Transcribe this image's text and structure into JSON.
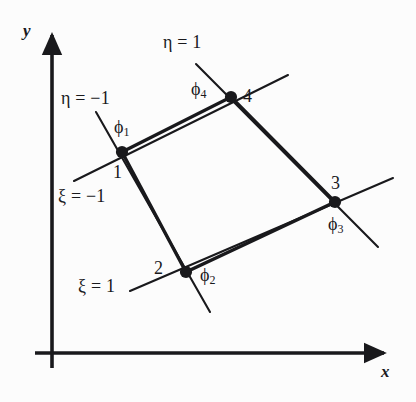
{
  "figure": {
    "background_color": "#fcfcfc",
    "line_color": "#19191c",
    "width": 416,
    "height": 402
  },
  "axes": {
    "x_label": "x",
    "y_label": "y",
    "origin": {
      "x": 52,
      "y": 353
    },
    "x_axis": {
      "start_x": 35,
      "end_x": 392,
      "y": 353
    },
    "y_axis": {
      "x": 52,
      "start_y": 368,
      "end_y": 27
    }
  },
  "element": {
    "nodes": [
      {
        "id": "1",
        "number_label": "1",
        "phi_label": "ϕ",
        "phi_sub": "1",
        "x": 122,
        "y": 152
      },
      {
        "id": "2",
        "number_label": "2",
        "phi_label": "ϕ",
        "phi_sub": "2",
        "x": 186,
        "y": 272
      },
      {
        "id": "3",
        "number_label": "3",
        "phi_label": "ϕ",
        "phi_sub": "3",
        "x": 335,
        "y": 202
      },
      {
        "id": "4",
        "number_label": "4",
        "phi_label": "ϕ",
        "phi_sub": "4",
        "x": 231,
        "y": 97
      }
    ],
    "edges": [
      {
        "from": "1",
        "to": "4"
      },
      {
        "from": "4",
        "to": "3"
      },
      {
        "from": "3",
        "to": "2"
      },
      {
        "from": "2",
        "to": "1"
      }
    ]
  },
  "natural_coordinate_lines": [
    {
      "name": "eta-minus-one",
      "label": "η = −1",
      "label_x": 78,
      "label_y": 100,
      "through_node": "1",
      "from": {
        "x": 96,
        "y": 112
      },
      "to": {
        "x": 210,
        "y": 312
      }
    },
    {
      "name": "xi-minus-one",
      "label": "ξ = −1",
      "label_x": 83,
      "label_y": 198,
      "through_node": "1",
      "from": {
        "x": 74,
        "y": 181
      },
      "to": {
        "x": 288,
        "y": 75
      }
    },
    {
      "name": "eta-plus-one",
      "label": "η = 1",
      "label_x": 185,
      "label_y": 44,
      "through_node": "4",
      "from": {
        "x": 196,
        "y": 64
      },
      "to": {
        "x": 378,
        "y": 247
      }
    },
    {
      "name": "xi-plus-one",
      "label": "ξ = 1",
      "label_x": 98,
      "label_y": 288,
      "through_node": "2",
      "from": {
        "x": 130,
        "y": 291
      },
      "to": {
        "x": 393,
        "y": 178
      }
    }
  ]
}
